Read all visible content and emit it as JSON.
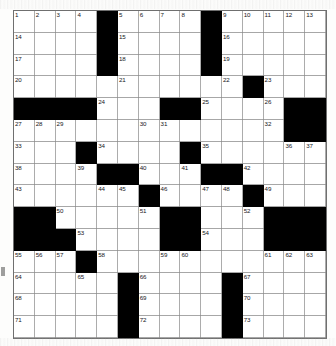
{
  "puzzle": {
    "title": "Crossword Grid",
    "rows": 15,
    "cols": 15,
    "cell_color": "#ffffff",
    "block_color": "#000000",
    "grid_line_color": "#8a8a8a",
    "number_color": "#16161a",
    "total_clue_numbers": 73,
    "layout": [
      "...._....._.....",
      "...._....._.....",
      "...._....._.....",
      ".....____.._....",
      "____.__.__.._###",
      "...........__###",
      "..._...._....__.",
      "..._..__.._..._.",
      "...._._.._..._..",
      "__.....___..._..",
      "___....__....___",
      "..._......_...__",
      "..._._...._._...",
      "..._._...._._...",
      "..._._...._._..."
    ],
    "blocks": [
      [
        0,
        4
      ],
      [
        0,
        9
      ],
      [
        1,
        4
      ],
      [
        1,
        9
      ],
      [
        2,
        4
      ],
      [
        2,
        9
      ],
      [
        3,
        11
      ],
      [
        4,
        0
      ],
      [
        4,
        1
      ],
      [
        4,
        2
      ],
      [
        4,
        3
      ],
      [
        4,
        7
      ],
      [
        4,
        8
      ],
      [
        4,
        13
      ],
      [
        4,
        14
      ],
      [
        5,
        13
      ],
      [
        5,
        14
      ],
      [
        6,
        3
      ],
      [
        6,
        8
      ],
      [
        7,
        4
      ],
      [
        7,
        5
      ],
      [
        7,
        9
      ],
      [
        7,
        10
      ],
      [
        8,
        6
      ],
      [
        8,
        11
      ],
      [
        9,
        0
      ],
      [
        9,
        1
      ],
      [
        9,
        7
      ],
      [
        9,
        8
      ],
      [
        9,
        12
      ],
      [
        9,
        13
      ],
      [
        9,
        14
      ],
      [
        10,
        0
      ],
      [
        10,
        1
      ],
      [
        10,
        2
      ],
      [
        10,
        7
      ],
      [
        10,
        8
      ],
      [
        10,
        12
      ],
      [
        10,
        13
      ],
      [
        10,
        14
      ],
      [
        11,
        3
      ],
      [
        12,
        5
      ],
      [
        12,
        10
      ],
      [
        13,
        5
      ],
      [
        13,
        10
      ],
      [
        14,
        5
      ],
      [
        14,
        10
      ]
    ],
    "numbers": [
      {
        "n": 1,
        "row": 0,
        "col": 0
      },
      {
        "n": 2,
        "row": 0,
        "col": 1
      },
      {
        "n": 3,
        "row": 0,
        "col": 2
      },
      {
        "n": 4,
        "row": 0,
        "col": 3
      },
      {
        "n": 5,
        "row": 0,
        "col": 5
      },
      {
        "n": 6,
        "row": 0,
        "col": 6
      },
      {
        "n": 7,
        "row": 0,
        "col": 7
      },
      {
        "n": 8,
        "row": 0,
        "col": 8
      },
      {
        "n": 9,
        "row": 0,
        "col": 10
      },
      {
        "n": 10,
        "row": 0,
        "col": 11
      },
      {
        "n": 11,
        "row": 0,
        "col": 12
      },
      {
        "n": 12,
        "row": 0,
        "col": 13
      },
      {
        "n": 13,
        "row": 0,
        "col": 14
      },
      {
        "n": 14,
        "row": 1,
        "col": 0
      },
      {
        "n": 15,
        "row": 1,
        "col": 5
      },
      {
        "n": 16,
        "row": 1,
        "col": 10
      },
      {
        "n": 17,
        "row": 2,
        "col": 0
      },
      {
        "n": 18,
        "row": 2,
        "col": 5
      },
      {
        "n": 19,
        "row": 2,
        "col": 10
      },
      {
        "n": 20,
        "row": 3,
        "col": 0
      },
      {
        "n": 21,
        "row": 3,
        "col": 5
      },
      {
        "n": 22,
        "row": 3,
        "col": 10
      },
      {
        "n": 23,
        "row": 3,
        "col": 12
      },
      {
        "n": 24,
        "row": 4,
        "col": 4
      },
      {
        "n": 25,
        "row": 4,
        "col": 9
      },
      {
        "n": 26,
        "row": 4,
        "col": 12
      },
      {
        "n": 27,
        "row": 5,
        "col": 0
      },
      {
        "n": 28,
        "row": 5,
        "col": 1
      },
      {
        "n": 29,
        "row": 5,
        "col": 2
      },
      {
        "n": 30,
        "row": 5,
        "col": 6
      },
      {
        "n": 31,
        "row": 5,
        "col": 7
      },
      {
        "n": 32,
        "row": 5,
        "col": 12
      },
      {
        "n": 33,
        "row": 6,
        "col": 0
      },
      {
        "n": 34,
        "row": 6,
        "col": 4
      },
      {
        "n": 35,
        "row": 6,
        "col": 9
      },
      {
        "n": 36,
        "row": 6,
        "col": 13
      },
      {
        "n": 37,
        "row": 6,
        "col": 14
      },
      {
        "n": 38,
        "row": 7,
        "col": 0
      },
      {
        "n": 39,
        "row": 7,
        "col": 3
      },
      {
        "n": 40,
        "row": 7,
        "col": 6
      },
      {
        "n": 41,
        "row": 7,
        "col": 8
      },
      {
        "n": 42,
        "row": 7,
        "col": 11
      },
      {
        "n": 43,
        "row": 8,
        "col": 0
      },
      {
        "n": 44,
        "row": 8,
        "col": 4
      },
      {
        "n": 45,
        "row": 8,
        "col": 5
      },
      {
        "n": 46,
        "row": 8,
        "col": 7
      },
      {
        "n": 47,
        "row": 8,
        "col": 9
      },
      {
        "n": 48,
        "row": 8,
        "col": 10
      },
      {
        "n": 49,
        "row": 8,
        "col": 12
      },
      {
        "n": 50,
        "row": 9,
        "col": 2
      },
      {
        "n": 51,
        "row": 9,
        "col": 6
      },
      {
        "n": 52,
        "row": 9,
        "col": 11
      },
      {
        "n": 53,
        "row": 10,
        "col": 3
      },
      {
        "n": 54,
        "row": 10,
        "col": 9
      },
      {
        "n": 55,
        "row": 11,
        "col": 0
      },
      {
        "n": 56,
        "row": 11,
        "col": 1
      },
      {
        "n": 57,
        "row": 11,
        "col": 2
      },
      {
        "n": 58,
        "row": 11,
        "col": 4
      },
      {
        "n": 59,
        "row": 11,
        "col": 7
      },
      {
        "n": 60,
        "row": 11,
        "col": 8
      },
      {
        "n": 61,
        "row": 11,
        "col": 12
      },
      {
        "n": 62,
        "row": 11,
        "col": 13
      },
      {
        "n": 63,
        "row": 11,
        "col": 14
      },
      {
        "n": 64,
        "row": 12,
        "col": 0
      },
      {
        "n": 65,
        "row": 12,
        "col": 3
      },
      {
        "n": 66,
        "row": 12,
        "col": 6
      },
      {
        "n": 67,
        "row": 12,
        "col": 11
      },
      {
        "n": 68,
        "row": 13,
        "col": 0
      },
      {
        "n": 69,
        "row": 13,
        "col": 6
      },
      {
        "n": 70,
        "row": 13,
        "col": 11
      },
      {
        "n": 71,
        "row": 14,
        "col": 0
      },
      {
        "n": 72,
        "row": 14,
        "col": 6
      },
      {
        "n": 73,
        "row": 14,
        "col": 11
      }
    ],
    "letters": []
  }
}
